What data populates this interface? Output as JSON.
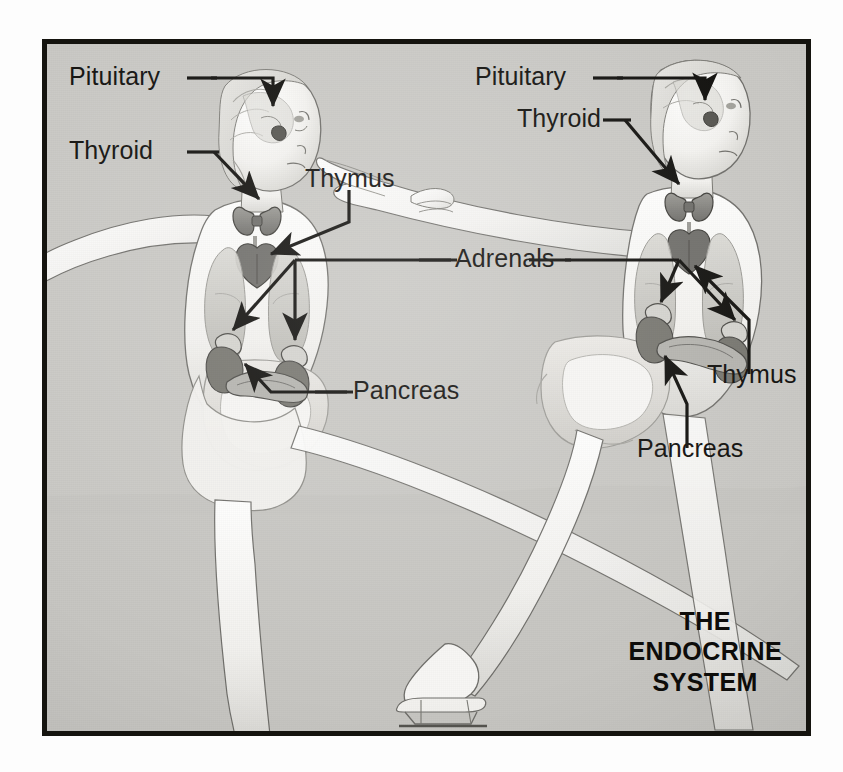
{
  "figure": {
    "title_lines": [
      "THE",
      "ENDOCRINE",
      "SYSTEM"
    ],
    "caption_full": "THE ENDOCRINE SYSTEM",
    "medium": "airbrush-illustration",
    "subjects": "two ice skaters with endocrine organs overlaid",
    "background_color": "#c9c8c4",
    "frame_color": "#15140f",
    "ink_color": "#100f0c",
    "organ_tint": "#8e8d88"
  },
  "labels": {
    "left_figure": [
      {
        "id": "pituitary",
        "text": "Pituitary"
      },
      {
        "id": "thyroid",
        "text": "Thyroid"
      },
      {
        "id": "thymus",
        "text": "Thymus"
      },
      {
        "id": "pancreas",
        "text": "Pancreas"
      }
    ],
    "right_figure": [
      {
        "id": "pituitary",
        "text": "Pituitary"
      },
      {
        "id": "thyroid",
        "text": "Thyroid"
      },
      {
        "id": "thymus",
        "text": "Thymus"
      },
      {
        "id": "pancreas",
        "text": "Pancreas"
      }
    ],
    "shared": [
      {
        "id": "adrenals",
        "text": "Adrenals"
      }
    ]
  },
  "organs_depicted": [
    "Pituitary",
    "Thyroid",
    "Thymus",
    "Adrenals",
    "Pancreas"
  ]
}
